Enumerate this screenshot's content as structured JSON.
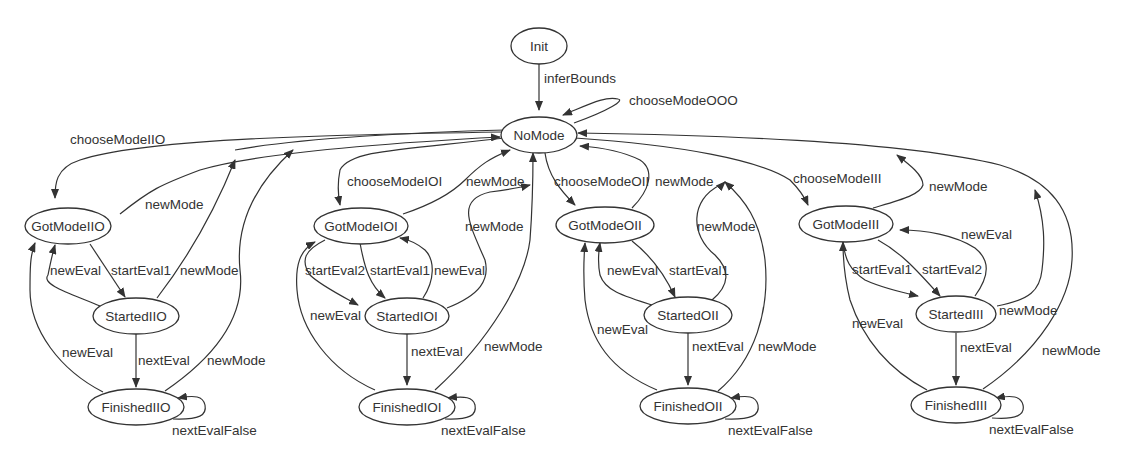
{
  "diagram": {
    "type": "state-machine",
    "nodes": {
      "init": "Init",
      "nomode": "NoMode",
      "gotmodeiio": "GotModeIIO",
      "startediio": "StartedIIO",
      "finishediio": "FinishedIIO",
      "gotmodeioi": "GotModeIOI",
      "startedioi": "StartedIOI",
      "finishedioi": "FinishedIOI",
      "gotmodeoii": "GotModeOII",
      "startedoii": "StartedOII",
      "finishedoii": "FinishedOII",
      "gotmodeiii": "GotModeIII",
      "startediii": "StartedIII",
      "finishediii": "FinishedIII"
    },
    "edges": {
      "init_nomode": "inferBounds",
      "nomode_self": "chooseModeOOO",
      "nomode_gotmodeiio": "chooseModeIIO",
      "gotmodeiio_nomode": "newMode",
      "gotmodeiio_startediio": "startEval1",
      "startediio_gotmodeiio": "newEval",
      "startediio_nomode": "newMode",
      "startediio_finishediio": "nextEval",
      "finishediio_gotmodeiio": "newEval",
      "finishediio_nomode": "newMode",
      "finishediio_self": "nextEvalFalse",
      "nomode_gotmodeioi": "chooseModeIOI",
      "gotmodeioi_nomode": "newMode",
      "gotmodeioi_startedioi_2": "startEval2",
      "gotmodeioi_startedioi_1": "startEval1",
      "startedioi_gotmodeioi": "newEval",
      "startedioi_nomode": "newMode",
      "startedioi_finishedioi": "nextEval",
      "finishedioi_gotmodeioi": "newEval",
      "finishedioi_nomode": "newMode",
      "finishedioi_self": "nextEvalFalse",
      "nomode_gotmodeoii": "chooseModeOII",
      "gotmodeoii_nomode": "newMode",
      "gotmodeoii_startedoii": "startEval1",
      "startedoii_gotmodeoii": "newEval",
      "startedoii_nomode": "newMode",
      "startedoii_finishedoii": "nextEval",
      "finishedoii_gotmodeoii": "newEval",
      "finishedoii_nomode": "newMode",
      "finishedoii_self": "nextEvalFalse",
      "nomode_gotmodeiii": "chooseModeIII",
      "gotmodeiii_nomode": "newMode",
      "gotmodeiii_startediii_1": "startEval1",
      "gotmodeiii_startediii_2": "startEval2",
      "startediii_gotmodeiii": "newEval",
      "startediii_nomode": "newMode",
      "startediii_finishediii": "nextEval",
      "finishediii_gotmodeiii": "newEval",
      "finishediii_nomode": "newMode",
      "finishediii_self": "nextEvalFalse"
    }
  }
}
